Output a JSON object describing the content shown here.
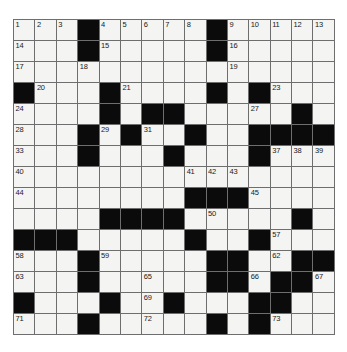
{
  "puzzle": {
    "kind": "crossword-grid",
    "rows": 15,
    "cols": 15,
    "colors": {
      "block": "#0b0b0b",
      "open": "#f4f4f2",
      "grid_line": "#6e6e6e",
      "number": "#1a1a1a",
      "page_background": "#ffffff"
    },
    "layout": [
      "...#.....#.....",
      "...#.....#.....",
      "...............",
      "#...#....#.#...",
      "....#.##.....#.",
      "...#.#..#..####",
      "...#...#...#...",
      "...............",
      "........###....",
      "....####.....#.",
      "###.....#..#...",
      "...#.....##..##",
      "...#.....##.##.",
      "#...#..#...##..",
      "...#.....#.#..."
    ],
    "numbers": {
      "r0": [
        {
          "col": 0,
          "label": "1"
        },
        {
          "col": 1,
          "label": "2"
        },
        {
          "col": 2,
          "label": "3"
        },
        {
          "col": 4,
          "label": "4"
        },
        {
          "col": 5,
          "label": "5"
        },
        {
          "col": 6,
          "label": "6"
        },
        {
          "col": 7,
          "label": "7"
        },
        {
          "col": 8,
          "label": "8"
        },
        {
          "col": 10,
          "label": "9"
        },
        {
          "col": 11,
          "label": "10"
        },
        {
          "col": 12,
          "label": "11"
        },
        {
          "col": 13,
          "label": "12"
        },
        {
          "col": 14,
          "label": "13"
        }
      ],
      "r1": [
        {
          "col": 0,
          "label": "14"
        },
        {
          "col": 4,
          "label": "15"
        },
        {
          "col": 10,
          "label": "16"
        }
      ],
      "r2": [
        {
          "col": 0,
          "label": "17"
        },
        {
          "col": 3,
          "label": "18"
        },
        {
          "col": 10,
          "label": "19"
        }
      ],
      "r3": [
        {
          "col": 1,
          "label": "20"
        },
        {
          "col": 5,
          "label": "21"
        },
        {
          "col": 9,
          "label": "22"
        },
        {
          "col": 12,
          "label": "23"
        }
      ],
      "r4": [
        {
          "col": 0,
          "label": "24"
        },
        {
          "col": 4,
          "label": "25"
        },
        {
          "col": 7,
          "label": "26"
        },
        {
          "col": 11,
          "label": "27"
        }
      ],
      "r5": [
        {
          "col": 0,
          "label": "28"
        },
        {
          "col": 4,
          "label": "29"
        },
        {
          "col": 5,
          "label": "30"
        },
        {
          "col": 6,
          "label": "31"
        },
        {
          "col": 8,
          "label": "32"
        }
      ],
      "r6": [
        {
          "col": 0,
          "label": "33"
        },
        {
          "col": 3,
          "label": "34"
        },
        {
          "col": 7,
          "label": "35"
        },
        {
          "col": 11,
          "label": "36"
        },
        {
          "col": 12,
          "label": "37"
        },
        {
          "col": 13,
          "label": "38"
        },
        {
          "col": 14,
          "label": "39"
        }
      ],
      "r7": [
        {
          "col": 0,
          "label": "40"
        },
        {
          "col": 8,
          "label": "41"
        },
        {
          "col": 9,
          "label": "42"
        },
        {
          "col": 10,
          "label": "43"
        }
      ],
      "r8": [
        {
          "col": 0,
          "label": "44"
        },
        {
          "col": 11,
          "label": "45"
        }
      ],
      "r9": [
        {
          "col": 4,
          "label": "46"
        },
        {
          "col": 5,
          "label": "47"
        },
        {
          "col": 6,
          "label": "48"
        },
        {
          "col": 7,
          "label": "49"
        },
        {
          "col": 9,
          "label": "50"
        },
        {
          "col": 13,
          "label": "51"
        }
      ],
      "r10": [
        {
          "col": 0,
          "label": "52"
        },
        {
          "col": 1,
          "label": "53"
        },
        {
          "col": 2,
          "label": "54"
        },
        {
          "col": 8,
          "label": "55"
        },
        {
          "col": 11,
          "label": "56"
        },
        {
          "col": 12,
          "label": "57"
        }
      ],
      "r11": [
        {
          "col": 0,
          "label": "58"
        },
        {
          "col": 4,
          "label": "59"
        },
        {
          "col": 9,
          "label": "60"
        },
        {
          "col": 10,
          "label": "61"
        },
        {
          "col": 12,
          "label": "62"
        }
      ],
      "r12": [
        {
          "col": 0,
          "label": "63"
        },
        {
          "col": 3,
          "label": "64"
        },
        {
          "col": 6,
          "label": "65"
        },
        {
          "col": 11,
          "label": "66"
        },
        {
          "col": 14,
          "label": "67"
        }
      ],
      "r13": [
        {
          "col": 0,
          "label": "68"
        },
        {
          "col": 6,
          "label": "69"
        },
        {
          "col": 12,
          "label": "70"
        }
      ],
      "r14": [
        {
          "col": 0,
          "label": "71"
        },
        {
          "col": 6,
          "label": "72"
        },
        {
          "col": 12,
          "label": "73"
        }
      ]
    }
  }
}
